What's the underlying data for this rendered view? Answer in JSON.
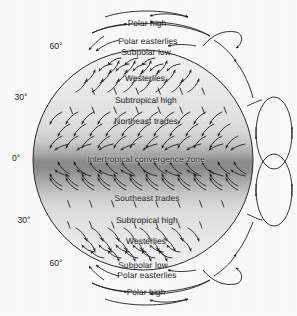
{
  "figure": {
    "type": "diagram",
    "background_color": "#fbfbfb",
    "line_color": "#222222",
    "text_color": "#1b1b1b"
  },
  "globe": {
    "center_x": 143,
    "center_y": 160,
    "radius": 110,
    "shading": {
      "pole_color": "#f2f2f2",
      "mid_color": "#e2e2e2",
      "tropic_color": "#b9b9b9",
      "equator_color": "#8a8a8a"
    }
  },
  "latitude_labels": [
    {
      "text": "60°",
      "x": 56,
      "y": 46
    },
    {
      "text": "30°",
      "x": 21,
      "y": 97
    },
    {
      "text": "0°",
      "x": 16,
      "y": 158
    },
    {
      "text": "30°",
      "x": 24,
      "y": 220
    },
    {
      "text": "60°",
      "x": 56,
      "y": 263
    }
  ],
  "zone_labels": [
    {
      "text": "Polar high",
      "x": 147,
      "y": 23,
      "halo": false
    },
    {
      "text": "Polar easterlies",
      "x": 148,
      "y": 41,
      "halo": false
    },
    {
      "text": "Subpolar low",
      "x": 146,
      "y": 52,
      "halo": false
    },
    {
      "text": "Westerlies",
      "x": 145,
      "y": 78,
      "halo": true
    },
    {
      "text": "Subtropical high",
      "x": 146,
      "y": 100,
      "halo": true
    },
    {
      "text": "Northeast trades",
      "x": 146,
      "y": 121,
      "halo": true
    },
    {
      "text": "Intertropical convergence zone",
      "x": 146,
      "y": 159,
      "halo": true
    },
    {
      "text": "Southeast trades",
      "x": 147,
      "y": 198,
      "halo": true
    },
    {
      "text": "Subtropical high",
      "x": 147,
      "y": 220,
      "halo": true
    },
    {
      "text": "Westerlies",
      "x": 146,
      "y": 241,
      "halo": true
    },
    {
      "text": "Subpolar low",
      "x": 143,
      "y": 265,
      "halo": false
    },
    {
      "text": "Polar easterlies",
      "x": 147,
      "y": 275,
      "halo": false
    },
    {
      "text": "Polar high",
      "x": 146,
      "y": 292,
      "halo": false
    }
  ],
  "cells": [
    {
      "name": "northern-hadley-cell",
      "cx": 274,
      "cy": 133,
      "rx": 18,
      "ry": 36
    },
    {
      "name": "southern-hadley-cell",
      "cx": 274,
      "cy": 190,
      "rx": 18,
      "ry": 36
    }
  ],
  "wind_bands": [
    {
      "name": "polar-easterlies-north",
      "direction": "east-to-west"
    },
    {
      "name": "westerlies-north",
      "direction": "west-to-east"
    },
    {
      "name": "northeast-trades",
      "direction": "northeast-to-southwest"
    },
    {
      "name": "southeast-trades",
      "direction": "southeast-to-northwest"
    },
    {
      "name": "westerlies-south",
      "direction": "west-to-east"
    },
    {
      "name": "polar-easterlies-south",
      "direction": "east-to-west"
    }
  ]
}
